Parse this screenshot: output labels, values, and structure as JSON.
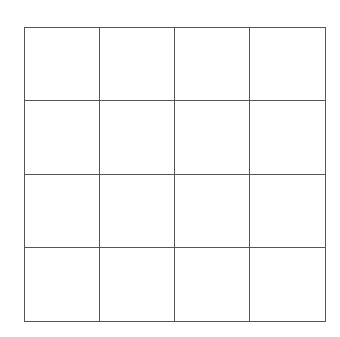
{
  "grid": {
    "rows": 4,
    "columns": 4,
    "line_color": "#555555",
    "background": "#ffffff",
    "cells": [
      [
        "",
        "",
        "",
        ""
      ],
      [
        "",
        "",
        "",
        ""
      ],
      [
        "",
        "",
        "",
        ""
      ],
      [
        "",
        "",
        "",
        ""
      ]
    ]
  }
}
